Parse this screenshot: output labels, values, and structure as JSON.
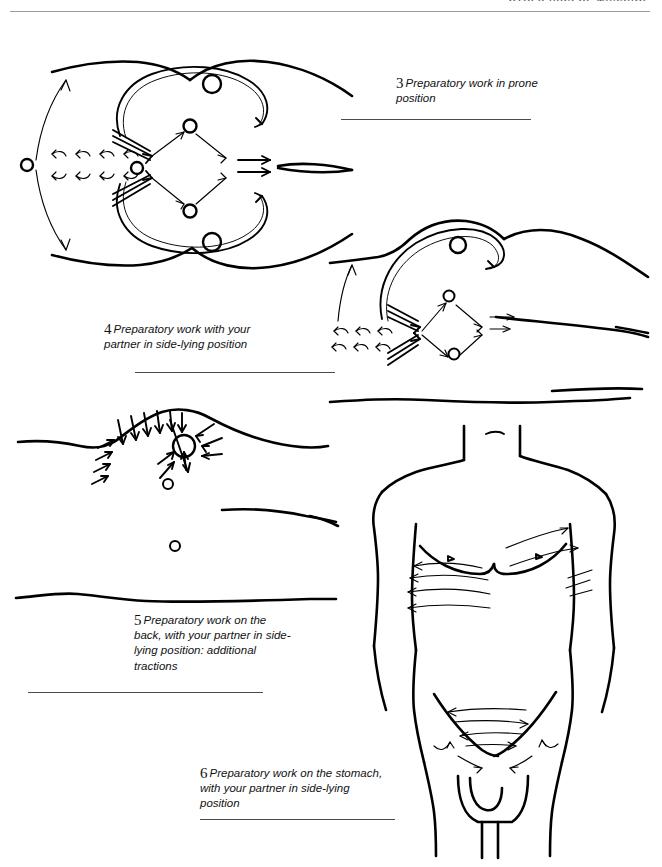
{
  "page": {
    "width": 662,
    "height": 867,
    "background": "#ffffff",
    "ink_color": "#000000",
    "rule_color": "#4a4a4f"
  },
  "running_head": {
    "text": "OTHER AIDS OF MASSAGE"
  },
  "figures": [
    {
      "number": "3",
      "caption": "Preparatory work in prone position",
      "caption_lines": [
        "Preparatory work in",
        "prone position"
      ],
      "subject": "back-prone-view-with-massage-direction-arrows",
      "position": "top-left"
    },
    {
      "number": "4",
      "caption": "Preparatory work with your partner in side-lying position",
      "caption_lines": [
        "Preparatory work with",
        "your partner in side-lying",
        "position"
      ],
      "subject": "side-lying-shoulder-and-back-with-massage-direction-arrows",
      "position": "middle-right"
    },
    {
      "number": "5",
      "caption": "Preparatory work on the back, with your partner in side-lying position: additional tractions",
      "caption_lines": [
        "Preparatory work on",
        "the back, with your",
        "partner in side-lying",
        "position: additional",
        "tractions"
      ],
      "subject": "back-side-lying-with-converging-traction-arrows",
      "position": "lower-left"
    },
    {
      "number": "6",
      "caption": "Preparatory work on the stomach, with your partner in side-lying position",
      "caption_lines": [
        "Preparatory work on the",
        "stomach, with your partner",
        "in side-lying position"
      ],
      "subject": "frontal-torso-with-chest-and-abdomen-stroke-arrows",
      "position": "lower-right"
    }
  ]
}
